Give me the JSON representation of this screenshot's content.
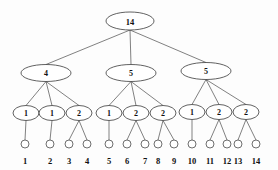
{
  "figure": {
    "name": "cluster-count-tree",
    "background_color": "#fdfdfd",
    "line_color": "#4a4a4a",
    "text_color": "#111111",
    "width": 278,
    "height": 170
  },
  "levels": {
    "root": {
      "nodes": [
        {
          "id": "root",
          "label": "14",
          "cx": 130,
          "cy": 21,
          "rx": 24,
          "ry": 9
        }
      ]
    },
    "level2": {
      "nodes": [
        {
          "id": "L2-0",
          "label": "4",
          "cx": 46,
          "cy": 73,
          "rx": 25,
          "ry": 8.5
        },
        {
          "id": "L2-1",
          "label": "5",
          "cx": 131,
          "cy": 73,
          "rx": 25,
          "ry": 8.5
        },
        {
          "id": "L2-2",
          "label": "5",
          "cx": 206,
          "cy": 71,
          "rx": 25,
          "ry": 8.5
        }
      ]
    },
    "level3": {
      "nodes": [
        {
          "id": "L3-0",
          "label": "1",
          "cx": 26,
          "cy": 113,
          "rx": 13,
          "ry": 7.5
        },
        {
          "id": "L3-1",
          "label": "1",
          "cx": 52,
          "cy": 113,
          "rx": 13,
          "ry": 7.5
        },
        {
          "id": "L3-2",
          "label": "2",
          "cx": 79,
          "cy": 113,
          "rx": 13,
          "ry": 7.5
        },
        {
          "id": "L3-3",
          "label": "1",
          "cx": 109,
          "cy": 113,
          "rx": 13,
          "ry": 7.5
        },
        {
          "id": "L3-4",
          "label": "2",
          "cx": 136,
          "cy": 113,
          "rx": 13,
          "ry": 7.5
        },
        {
          "id": "L3-5",
          "label": "2",
          "cx": 163,
          "cy": 113,
          "rx": 13,
          "ry": 7.5
        },
        {
          "id": "L3-6",
          "label": "1",
          "cx": 192,
          "cy": 112,
          "rx": 13,
          "ry": 7.5
        },
        {
          "id": "L3-7",
          "label": "2",
          "cx": 219,
          "cy": 112,
          "rx": 13,
          "ry": 7.5
        },
        {
          "id": "L3-8",
          "label": "2",
          "cx": 246,
          "cy": 112,
          "rx": 13,
          "ry": 7.5
        }
      ]
    },
    "leaves": {
      "radius": 4,
      "cy": 144,
      "label_y": 164,
      "nodes": [
        {
          "id": "leaf-1",
          "label": "1",
          "cx": 25
        },
        {
          "id": "leaf-2",
          "label": "2",
          "cx": 50
        },
        {
          "id": "leaf-3",
          "label": "3",
          "cx": 69
        },
        {
          "id": "leaf-4",
          "label": "4",
          "cx": 87
        },
        {
          "id": "leaf-5",
          "label": "5",
          "cx": 109
        },
        {
          "id": "leaf-6",
          "label": "6",
          "cx": 127
        },
        {
          "id": "leaf-7",
          "label": "7",
          "cx": 145
        },
        {
          "id": "leaf-8",
          "label": "8",
          "cx": 158
        },
        {
          "id": "leaf-9",
          "label": "9",
          "cx": 174
        },
        {
          "id": "leaf-10",
          "label": "10",
          "cx": 192
        },
        {
          "id": "leaf-11",
          "label": "11",
          "cx": 210
        },
        {
          "id": "leaf-12",
          "label": "12",
          "cx": 227
        },
        {
          "id": "leaf-13",
          "label": "13",
          "cx": 238
        },
        {
          "id": "leaf-14",
          "label": "14",
          "cx": 256
        }
      ]
    }
  },
  "edges": {
    "root_to_level2": [
      {
        "from": "root",
        "to": "L2-0"
      },
      {
        "from": "root",
        "to": "L2-1"
      },
      {
        "from": "root",
        "to": "L2-2"
      }
    ],
    "level2_to_level3": [
      {
        "from": "L2-0",
        "to": "L3-0"
      },
      {
        "from": "L2-0",
        "to": "L3-1"
      },
      {
        "from": "L2-0",
        "to": "L3-2"
      },
      {
        "from": "L2-1",
        "to": "L3-3"
      },
      {
        "from": "L2-1",
        "to": "L3-4"
      },
      {
        "from": "L2-1",
        "to": "L3-5"
      },
      {
        "from": "L2-2",
        "to": "L3-6"
      },
      {
        "from": "L2-2",
        "to": "L3-7"
      },
      {
        "from": "L2-2",
        "to": "L3-8"
      }
    ],
    "level3_to_leaves": [
      {
        "from": "L3-0",
        "to": "leaf-1"
      },
      {
        "from": "L3-1",
        "to": "leaf-2"
      },
      {
        "from": "L3-2",
        "to": "leaf-3"
      },
      {
        "from": "L3-2",
        "to": "leaf-4"
      },
      {
        "from": "L3-3",
        "to": "leaf-5"
      },
      {
        "from": "L3-4",
        "to": "leaf-6"
      },
      {
        "from": "L3-4",
        "to": "leaf-7"
      },
      {
        "from": "L3-5",
        "to": "leaf-8"
      },
      {
        "from": "L3-5",
        "to": "leaf-9"
      },
      {
        "from": "L3-6",
        "to": "leaf-10"
      },
      {
        "from": "L3-7",
        "to": "leaf-11"
      },
      {
        "from": "L3-7",
        "to": "leaf-12"
      },
      {
        "from": "L3-8",
        "to": "leaf-13"
      },
      {
        "from": "L3-8",
        "to": "leaf-14"
      }
    ]
  }
}
